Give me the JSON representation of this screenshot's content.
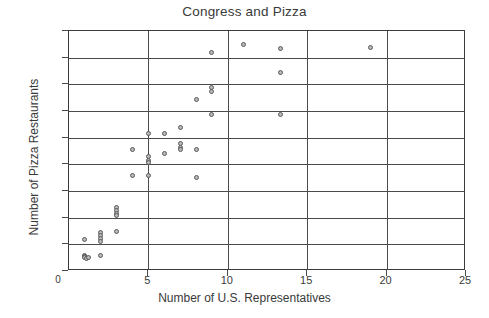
{
  "chart_data": {
    "type": "scatter",
    "title": "Congress and Pizza",
    "xlabel": "Number of U.S. Representatives",
    "ylabel": "Number of Pizza Restaurants",
    "xlim": [
      0,
      25
    ],
    "ylim": [
      0,
      1800
    ],
    "xticks": [
      0,
      5,
      10,
      15,
      20,
      25
    ],
    "xtick_labels": [
      "0",
      "5",
      "10",
      "15",
      "20",
      "25"
    ],
    "yticks": [
      0,
      200,
      400,
      600,
      800,
      1000,
      1200,
      1400,
      1600,
      1800
    ],
    "ytick_labels": [
      "0",
      "200",
      "400",
      "600",
      "800",
      "1000",
      "1200",
      "1400",
      "1600",
      "1800"
    ],
    "grid": "horizontal-and-vertical",
    "grid_x": [
      5,
      10,
      15,
      20
    ],
    "grid_y": [
      200,
      400,
      600,
      800,
      1000,
      1200,
      1400,
      1600
    ],
    "legend": null,
    "marker": "open-circle",
    "marker_color": "#b9b9b9",
    "marker_edge_color": "#5a5a5a",
    "points": [
      {
        "x": 1,
        "y": 240
      },
      {
        "x": 1,
        "y": 120
      },
      {
        "x": 1,
        "y": 110
      },
      {
        "x": 1,
        "y": 100
      },
      {
        "x": 1.1,
        "y": 95
      },
      {
        "x": 1.2,
        "y": 105
      },
      {
        "x": 2,
        "y": 290
      },
      {
        "x": 2,
        "y": 265
      },
      {
        "x": 2,
        "y": 245
      },
      {
        "x": 2,
        "y": 225
      },
      {
        "x": 2,
        "y": 120
      },
      {
        "x": 3,
        "y": 480
      },
      {
        "x": 3,
        "y": 455
      },
      {
        "x": 3,
        "y": 430
      },
      {
        "x": 3,
        "y": 420
      },
      {
        "x": 3,
        "y": 295
      },
      {
        "x": 4,
        "y": 910
      },
      {
        "x": 4,
        "y": 715
      },
      {
        "x": 5,
        "y": 1035
      },
      {
        "x": 5,
        "y": 860
      },
      {
        "x": 5,
        "y": 830
      },
      {
        "x": 5,
        "y": 815
      },
      {
        "x": 5,
        "y": 720
      },
      {
        "x": 6,
        "y": 1030
      },
      {
        "x": 6,
        "y": 885
      },
      {
        "x": 7,
        "y": 1075
      },
      {
        "x": 7,
        "y": 955
      },
      {
        "x": 7,
        "y": 930
      },
      {
        "x": 7,
        "y": 915
      },
      {
        "x": 8,
        "y": 1285
      },
      {
        "x": 8,
        "y": 910
      },
      {
        "x": 8,
        "y": 700
      },
      {
        "x": 9,
        "y": 1640
      },
      {
        "x": 9,
        "y": 1380
      },
      {
        "x": 9,
        "y": 1350
      },
      {
        "x": 9,
        "y": 1175
      },
      {
        "x": 11,
        "y": 1700
      },
      {
        "x": 13.3,
        "y": 1670
      },
      {
        "x": 13.3,
        "y": 1490
      },
      {
        "x": 13.3,
        "y": 1175
      },
      {
        "x": 19,
        "y": 1680
      }
    ]
  }
}
